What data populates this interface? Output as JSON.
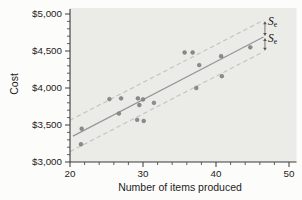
{
  "chart_data": {
    "type": "scatter",
    "title": "",
    "xlabel": "Number of items produced",
    "ylabel": "Cost",
    "xlim": [
      20,
      50
    ],
    "ylim": [
      3000,
      5000
    ],
    "grid": false,
    "legend": "none",
    "x_axis": {
      "major_ticks": [
        20,
        30,
        40,
        50
      ],
      "major_labels": [
        "20",
        "30",
        "40",
        "50"
      ],
      "minor_step": 2
    },
    "y_axis": {
      "major_ticks": [
        3000,
        3500,
        4000,
        4500,
        5000
      ],
      "major_labels": [
        "$3,000",
        "$3,500",
        "$4,000",
        "$4,500",
        "$5,000"
      ],
      "minor_step": 100
    },
    "points": [
      [
        21.5,
        3240
      ],
      [
        21.6,
        3450
      ],
      [
        25.4,
        3850
      ],
      [
        27.0,
        3860
      ],
      [
        26.7,
        3655
      ],
      [
        29.3,
        3860
      ],
      [
        30.0,
        3845
      ],
      [
        29.5,
        3770
      ],
      [
        29.2,
        3570
      ],
      [
        30.1,
        3555
      ],
      [
        31.5,
        3800
      ],
      [
        35.7,
        4480
      ],
      [
        36.8,
        4480
      ],
      [
        37.7,
        4310
      ],
      [
        37.3,
        4000
      ],
      [
        40.7,
        4430
      ],
      [
        40.8,
        4160
      ],
      [
        44.7,
        4550
      ]
    ],
    "regression_line": {
      "x1": 20.4,
      "y1": 3350,
      "x2": 46.5,
      "y2": 4690
    },
    "bands": {
      "upper": {
        "x1": 20.0,
        "y1": 3565,
        "x2": 46.5,
        "y2": 4915
      },
      "lower": {
        "x1": 20.0,
        "y1": 3140,
        "x2": 46.5,
        "y2": 4490
      },
      "offset_dollars": 215
    },
    "annotations": [
      {
        "base": "S",
        "sub": "e",
        "meaning": "standard-error-above-line"
      },
      {
        "base": "S",
        "sub": "e",
        "meaning": "standard-error-below-line"
      }
    ],
    "colors": {
      "plot_bg": "#ebebe7",
      "point": "#8c8c8c",
      "point_edge": "#6f6f6f",
      "regression": "#97979a",
      "band": "#c3c3bd",
      "axis": "#3a3a3a",
      "text": "#1c1c1c"
    }
  }
}
